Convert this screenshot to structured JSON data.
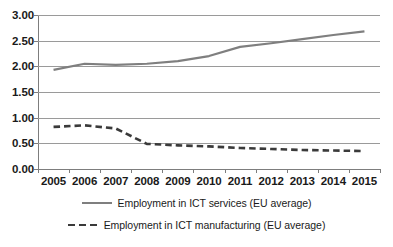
{
  "chart_data": {
    "type": "line",
    "title": "",
    "subtitle": "",
    "xlabel": "",
    "ylabel": "",
    "categories": [
      "2005",
      "2006",
      "2007",
      "2008",
      "2009",
      "2010",
      "2011",
      "2012",
      "2013",
      "2014",
      "2015"
    ],
    "ylim": [
      0.0,
      3.0
    ],
    "ytick_step": 0.5,
    "ytick_labels": [
      "3.00",
      "2.50",
      "2.00",
      "1.50",
      "1.00",
      "0.50",
      "0.00"
    ],
    "ytick_values": [
      3.0,
      2.5,
      2.0,
      1.5,
      1.0,
      0.5,
      0.0
    ],
    "grid": "horizontal",
    "legend_position": "bottom",
    "series": [
      {
        "name": "Employment in ICT services (EU average)",
        "style": "solid",
        "color": "#7f7f7f",
        "values": [
          1.93,
          2.05,
          2.03,
          2.05,
          2.1,
          2.2,
          2.38,
          2.45,
          2.53,
          2.61,
          2.68
        ]
      },
      {
        "name": "Employment in ICT manufacturing (EU average)",
        "style": "dashed",
        "color": "#3a3a3a",
        "values": [
          0.82,
          0.85,
          0.79,
          0.49,
          0.46,
          0.44,
          0.41,
          0.39,
          0.37,
          0.36,
          0.35
        ]
      }
    ]
  },
  "legend": {
    "items": [
      {
        "label": "Employment in ICT services (EU average)"
      },
      {
        "label": "Employment in ICT manufacturing (EU average)"
      }
    ]
  },
  "axis_colors": {
    "gridline": "#9a9a9a",
    "axis": "#7d7d7d",
    "text": "#1a1a1a"
  }
}
